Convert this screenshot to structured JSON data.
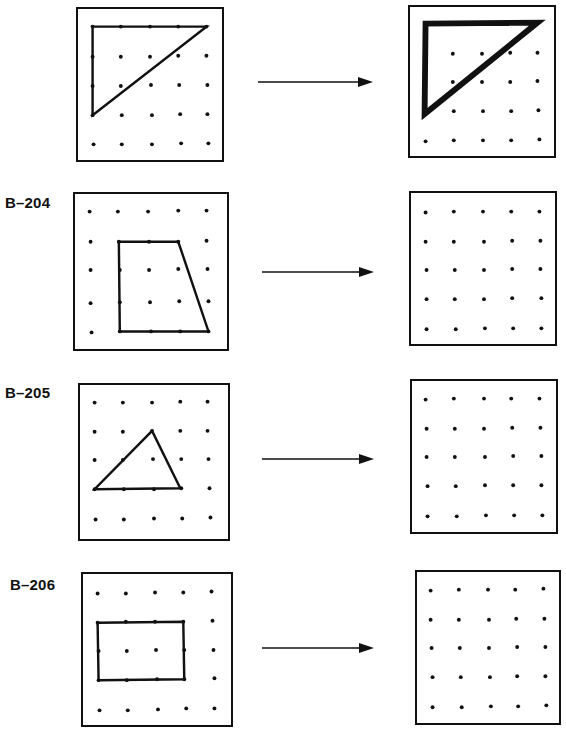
{
  "problems": [
    {
      "label": "",
      "left_shape": "triangle",
      "left_vertices": [
        [
          0,
          0
        ],
        [
          4,
          0
        ],
        [
          0,
          3
        ]
      ],
      "right_shape": "triangle-bold",
      "right_vertices": [
        [
          0,
          0
        ],
        [
          4,
          0
        ],
        [
          0,
          3
        ]
      ],
      "arrow": "arrow-right"
    },
    {
      "label": "B–204",
      "left_shape": "trapezoid",
      "left_vertices": [
        [
          1,
          1
        ],
        [
          3,
          1
        ],
        [
          4,
          4
        ],
        [
          1,
          4
        ]
      ],
      "right_shape": "empty",
      "arrow": "arrow-right"
    },
    {
      "label": "B–205",
      "left_shape": "triangle",
      "left_vertices": [
        [
          2,
          1
        ],
        [
          3,
          3
        ],
        [
          0,
          3
        ]
      ],
      "right_shape": "empty",
      "arrow": "arrow-right"
    },
    {
      "label": "B–206",
      "left_shape": "rectangle",
      "left_vertices": [
        [
          0,
          1
        ],
        [
          3,
          1
        ],
        [
          3,
          3
        ],
        [
          0,
          3
        ]
      ],
      "right_shape": "empty",
      "arrow": "arrow-right"
    }
  ],
  "geoboard": {
    "rows": 5,
    "cols": 5,
    "peg_color": "#111111",
    "line_color": "#111111"
  }
}
